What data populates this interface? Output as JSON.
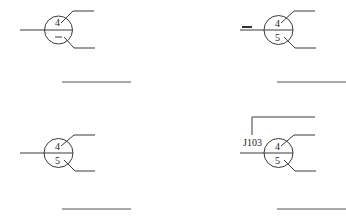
{
  "diagram": {
    "type": "connector-symbol-variants",
    "symbols": [
      {
        "id": "a",
        "top_label": "4",
        "bottom_label": "",
        "bottom_mark": "dash",
        "prefix_dash": false,
        "ref": ""
      },
      {
        "id": "b",
        "top_label": "4",
        "bottom_label": "5",
        "bottom_mark": "",
        "prefix_dash": true,
        "ref": ""
      },
      {
        "id": "c",
        "top_label": "4",
        "bottom_label": "5",
        "bottom_mark": "",
        "prefix_dash": false,
        "ref": ""
      },
      {
        "id": "d",
        "top_label": "4",
        "bottom_label": "5",
        "bottom_mark": "",
        "prefix_dash": false,
        "ref": "J103"
      }
    ],
    "colors": {
      "line": "#3a3a3a",
      "text": "#222222"
    }
  }
}
